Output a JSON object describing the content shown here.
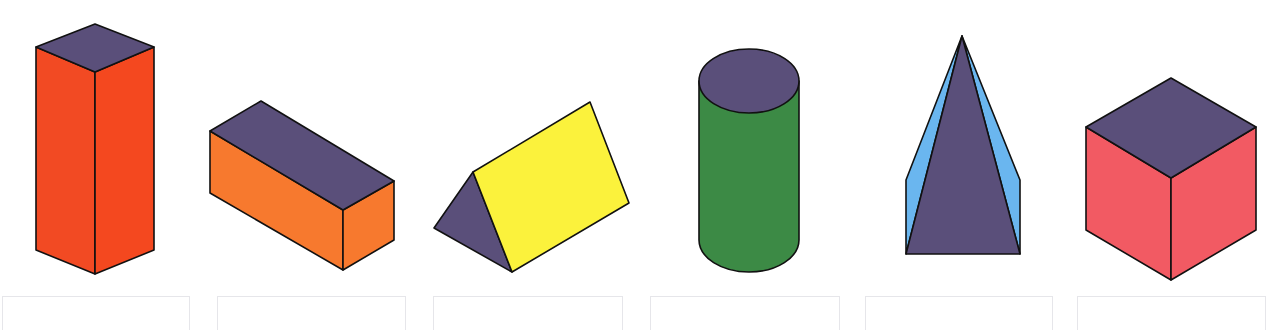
{
  "colors": {
    "top_face": "#5a4f7a",
    "tall_box_face": "#f24a23",
    "cuboid_face": "#f7792e",
    "prism_face": "#fbf23c",
    "cylinder_body": "#3c8a45",
    "pyramid_side": "#6ab6ef",
    "cube_face": "#f25a63",
    "outline": "#111111"
  },
  "shapes": [
    {
      "name": "square-prism",
      "label": ""
    },
    {
      "name": "rectangular-prism",
      "label": ""
    },
    {
      "name": "triangular-prism",
      "label": ""
    },
    {
      "name": "cylinder",
      "label": ""
    },
    {
      "name": "pyramid",
      "label": ""
    },
    {
      "name": "cube",
      "label": ""
    }
  ],
  "answer_boxes": [
    {
      "value": ""
    },
    {
      "value": ""
    },
    {
      "value": ""
    },
    {
      "value": ""
    },
    {
      "value": ""
    },
    {
      "value": ""
    }
  ]
}
